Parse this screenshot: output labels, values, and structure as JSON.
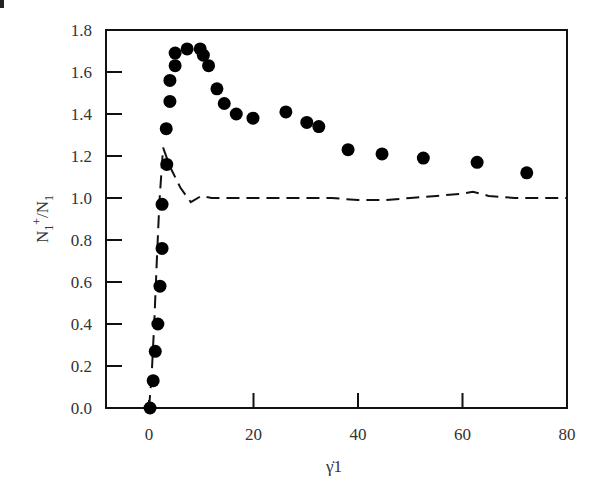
{
  "chart_data": {
    "type": "scatter",
    "title": "",
    "xlabel": "γ̇1",
    "ylabel": "N1+/N1",
    "ylabel_parts": {
      "main": "N",
      "sub1": "1",
      "sup": "+",
      "slash": "/N",
      "sub2": "1"
    },
    "xlim": [
      -8,
      80
    ],
    "ylim": [
      0,
      1.8
    ],
    "xticks": [
      0,
      20,
      40,
      60,
      80
    ],
    "yticks": [
      0.0,
      0.2,
      0.4,
      0.6,
      0.8,
      1.0,
      1.2,
      1.4,
      1.6,
      1.8
    ],
    "xtick_labels": [
      "0",
      "20",
      "40",
      "60",
      "80"
    ],
    "ytick_labels": [
      "0.0",
      "0.2",
      "0.4",
      "0.6",
      "0.8",
      "1.0",
      "1.2",
      "1.4",
      "1.6",
      "1.8"
    ],
    "grid": false,
    "legend": null,
    "series": [
      {
        "name": "measured",
        "style": "filled-circles",
        "color": "#000000",
        "x": [
          0.2,
          0.8,
          1.2,
          1.7,
          2.1,
          2.5,
          2.5,
          3.4,
          3.3,
          4.0,
          4.0,
          5.0,
          5.0,
          7.3,
          9.8,
          10.4,
          11.4,
          13.0,
          14.4,
          16.7,
          19.9,
          26.2,
          30.2,
          32.5,
          38.1,
          44.6,
          52.5,
          62.8,
          72.3
        ],
        "y": [
          0.0,
          0.13,
          0.27,
          0.4,
          0.58,
          0.76,
          0.97,
          1.16,
          1.33,
          1.46,
          1.56,
          1.63,
          1.69,
          1.71,
          1.71,
          1.68,
          1.63,
          1.52,
          1.45,
          1.4,
          1.38,
          1.41,
          1.36,
          1.34,
          1.23,
          1.21,
          1.19,
          1.17,
          1.12
        ]
      },
      {
        "name": "model",
        "style": "dashed-line",
        "color": "#000000",
        "x": [
          0,
          0.5,
          1.0,
          1.5,
          2.0,
          2.7,
          4.0,
          6.0,
          8.0,
          10,
          12,
          15,
          20,
          25,
          30,
          35,
          40,
          45,
          50,
          55,
          60,
          62,
          65,
          70,
          75,
          80
        ],
        "y": [
          0.0,
          0.15,
          0.4,
          0.7,
          0.98,
          1.24,
          1.15,
          1.05,
          0.98,
          1.01,
          1.0,
          1.0,
          1.0,
          1.0,
          1.0,
          1.0,
          0.99,
          0.99,
          1.0,
          1.01,
          1.02,
          1.03,
          1.01,
          1.0,
          1.0,
          1.0
        ]
      }
    ]
  },
  "axes": {
    "x_label": "γ̇1",
    "y_label_main": "N",
    "y_label_sub1": "1",
    "y_label_sup": "+",
    "y_label_slash": "/N",
    "y_label_sub2": "1"
  }
}
